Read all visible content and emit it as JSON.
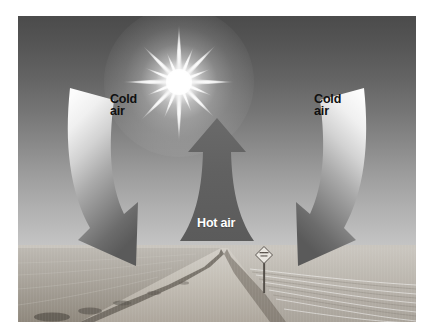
{
  "page": {
    "background_color": "#ffffff",
    "faint_header_ghost": "      "
  },
  "figure": {
    "type": "photograph-with-diagram-overlay",
    "photo": {
      "scene_description": "Flat open prairie landscape with a dirt road receding to the horizon, bright sun high in the sky, and a diamond road sign on a post at the right of the road",
      "color_mode": "grayscale",
      "sky_color_top": "#4b4b4b",
      "sky_color_horizon": "#c6c6c6",
      "ground_color_near": "#8e877d",
      "ground_color_far": "#b9b5ae",
      "horizon_position_percent": 75
    },
    "sun": {
      "name": "sun",
      "core_color": "#ffffff",
      "glow_color": "#ffffff",
      "ray_count": 16,
      "position_percent": {
        "x": 40.5,
        "y": 11
      }
    },
    "road_sign": {
      "name": "diamond-road-sign",
      "shape": "diamond",
      "position_percent": {
        "x": 70,
        "y": 80
      }
    }
  },
  "annotations": {
    "arrows": [
      {
        "id": "cold-air-left",
        "label": "Cold\nair",
        "direction": "curving down and inward",
        "label_color": "#101010",
        "fill_top_color": "#f2f2f2",
        "fill_bottom_color": "#5a5a5a"
      },
      {
        "id": "hot-air-center",
        "label": "Hot air",
        "direction": "up",
        "label_color": "#ffffff",
        "fill_color": "#5c5c5c"
      },
      {
        "id": "cold-air-right",
        "label": "Cold\nair",
        "direction": "curving down and inward",
        "label_color": "#101010",
        "fill_top_color": "#f2f2f2",
        "fill_bottom_color": "#5a5a5a"
      }
    ]
  }
}
